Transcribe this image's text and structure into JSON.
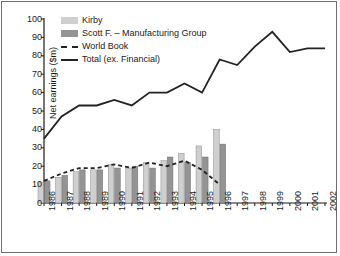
{
  "chart_data": {
    "type": "bar",
    "title": "",
    "xlabel": "",
    "ylabel": "Net earnings ($m)",
    "ylim": [
      0,
      100
    ],
    "ytick_values": [
      0,
      10,
      20,
      30,
      40,
      50,
      60,
      70,
      80,
      90,
      100
    ],
    "grid": false,
    "legend_position": "top-left",
    "categories": [
      "1986",
      "1987",
      "1988",
      "1989",
      "1990",
      "1991",
      "1992",
      "1993",
      "1994",
      "1995",
      "1996",
      "1997",
      "1998",
      "1999",
      "2000",
      "2001",
      "2002"
    ],
    "series": [
      {
        "name": "Kirby",
        "type": "bar",
        "color": "#cfcfcf",
        "values": [
          11,
          14,
          17,
          18,
          21,
          19,
          22,
          23,
          27,
          31,
          40,
          null,
          null,
          null,
          null,
          null,
          null
        ]
      },
      {
        "name": "Scott F. – Manufacturing Group",
        "type": "bar",
        "color": "#949494",
        "values": [
          12,
          15,
          18,
          18,
          19,
          20,
          19,
          25,
          22,
          25,
          32,
          null,
          null,
          null,
          null,
          null,
          null
        ]
      },
      {
        "name": "World Book",
        "type": "line",
        "style": "dashed",
        "color": "#222222",
        "values": [
          12,
          16,
          19,
          19,
          21,
          19,
          22,
          20,
          23,
          18,
          10,
          null,
          null,
          null,
          null,
          null,
          null
        ]
      },
      {
        "name": "Total (ex. Financial)",
        "type": "line",
        "style": "solid",
        "color": "#222222",
        "values": [
          35,
          47,
          53,
          53,
          56,
          53,
          60,
          60,
          65,
          60,
          78,
          75,
          85,
          93,
          82,
          84,
          84
        ]
      }
    ]
  },
  "legend": {
    "items": [
      {
        "label": "Kirby",
        "marker": "swatch-light"
      },
      {
        "label": "Scott F. – Manufacturing Group",
        "marker": "swatch-dark"
      },
      {
        "label": "World Book",
        "marker": "dashed-line"
      },
      {
        "label": "Total (ex. Financial)",
        "marker": "solid-line"
      }
    ]
  },
  "colors": {
    "kirby": "#cfcfcf",
    "scott": "#949494",
    "line": "#222222",
    "axis": "#1a1a1a",
    "border": "#6e6e6e"
  }
}
